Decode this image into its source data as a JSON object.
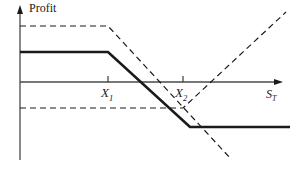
{
  "figure": {
    "type": "payoff-diagram",
    "background_color": "#ffffff",
    "line_color": "#1a1a1a"
  },
  "axes": {
    "y_axis_label": "Profit",
    "x_axis_label_base": "S",
    "x_axis_label_sub": "T",
    "y_axis_x_px": 20,
    "y_axis_top_px": 8,
    "y_axis_bottom_px": 160,
    "x_axis_y_px": 82,
    "x_axis_left_px": 20,
    "x_axis_right_px": 283,
    "arrowheads": [
      "y-axis-top",
      "x-axis-right"
    ]
  },
  "ticks": [
    {
      "name": "X1",
      "base": "X",
      "sub": "1",
      "x_px": 108
    },
    {
      "name": "X2",
      "base": "X",
      "sub": "2",
      "x_px": 183
    }
  ],
  "chart_data": {
    "type": "line",
    "title": "",
    "subtitle": "",
    "xlabel": "S_T",
    "ylabel": "Profit",
    "xlim": [
      0,
      296
    ],
    "ylim": [
      -1,
      1
    ],
    "grid": false,
    "legend": "none",
    "annotations": [
      "X_1",
      "X_2",
      "Profit",
      "S_T"
    ],
    "series": [
      {
        "name": "combined-payoff",
        "style": "solid",
        "width_px": 2.6,
        "color": "#1a1a1a",
        "points_px": [
          [
            20,
            52
          ],
          [
            108,
            52
          ],
          [
            190,
            127
          ],
          [
            290,
            127
          ]
        ],
        "description": "Thick solid combined profit: flat positive until X1, falls linearly to a flat negative level past X2."
      },
      {
        "name": "short-call-component",
        "style": "dashed",
        "width_px": 1.2,
        "color": "#1a1a1a",
        "points_px": [
          [
            20,
            26
          ],
          [
            108,
            26
          ],
          [
            231,
            159
          ]
        ],
        "description": "Dashed short call: flat at higher premium until X1 then declining with slope -1."
      },
      {
        "name": "long-call-component",
        "style": "dashed",
        "width_px": 1.2,
        "color": "#1a1a1a",
        "points_px": [
          [
            20,
            108
          ],
          [
            183,
            108
          ],
          [
            286,
            12
          ]
        ],
        "description": "Dashed long call: flat negative premium until X2 then rising with slope +1."
      }
    ]
  }
}
